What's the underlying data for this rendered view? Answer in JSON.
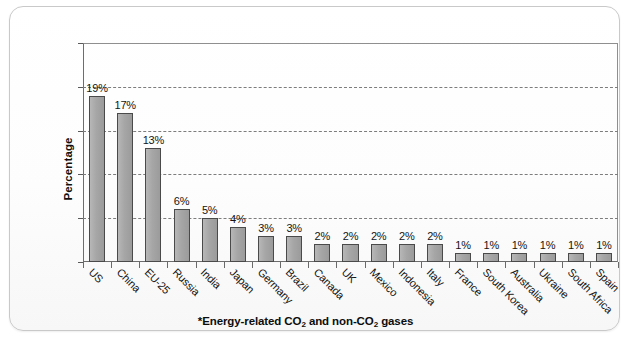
{
  "chart_data": {
    "type": "bar",
    "title": "",
    "subtitle": "",
    "xlabel": "",
    "ylabel": "Percentage",
    "ylim": [
      0,
      25
    ],
    "ytick_values": [
      0,
      5,
      10,
      15,
      20,
      25
    ],
    "ytick_labels": [
      "0%",
      "5%",
      "10%",
      "15%",
      "20%",
      "25%"
    ],
    "grid": "horizontal-dashed",
    "legend": "none",
    "categories": [
      "US",
      "China",
      "EU-25",
      "Russia",
      "India",
      "Japan",
      "Germany",
      "Brazil",
      "Canada",
      "UK",
      "Mexico",
      "Indonesia",
      "Italy",
      "France",
      "South Korea",
      "Australia",
      "Ukraine",
      "South Africa",
      "Spain"
    ],
    "values": [
      19,
      17,
      13,
      6,
      5,
      4,
      3,
      3,
      2,
      2,
      2,
      2,
      2,
      1,
      1,
      1,
      1,
      1,
      1
    ],
    "value_labels": [
      "19%",
      "17%",
      "13%",
      "6%",
      "5%",
      "4%",
      "3%",
      "3%",
      "2%",
      "2%",
      "2%",
      "2%",
      "2%",
      "1%",
      "1%",
      "1%",
      "1%",
      "1%",
      "1%"
    ],
    "bar_color": "#a6a6a6",
    "bar_edge_color": "#4a4a4a",
    "annotations": [
      "*Energy-related CO2 and non-CO2 gases"
    ]
  },
  "footnote": {
    "prefix": "*Energy-related CO",
    "sub1": "2",
    "middle": " and non-CO",
    "sub2": "2",
    "suffix": " gases"
  }
}
